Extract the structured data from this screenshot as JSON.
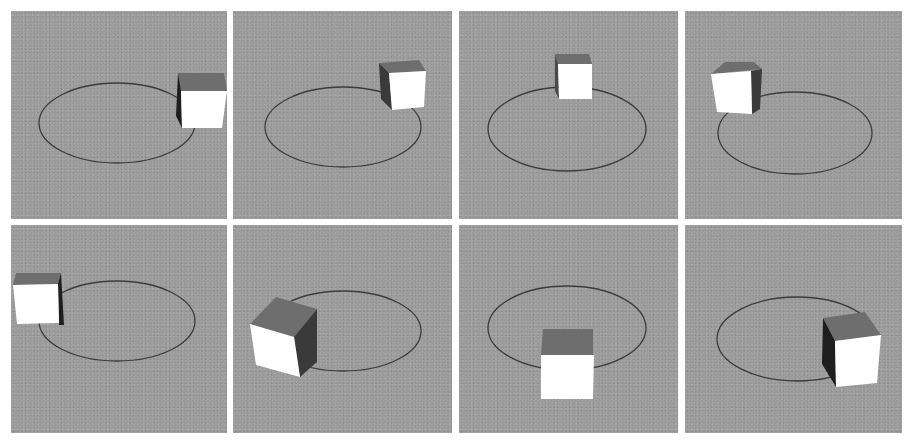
{
  "figure": {
    "background_color": "#ffffff",
    "panel_color": "#9a9a9a",
    "ellipse_color": "#3c3c3c",
    "cube_colors": {
      "front": "#ffffff",
      "top": "#6e6e6e",
      "side": "#3a3a3a"
    },
    "panels": [
      {
        "id": 1,
        "row": 1,
        "col": 1,
        "cube_position": "right"
      },
      {
        "id": 2,
        "row": 1,
        "col": 2,
        "cube_position": "upper-right"
      },
      {
        "id": 3,
        "row": 1,
        "col": 3,
        "cube_position": "top-center"
      },
      {
        "id": 4,
        "row": 1,
        "col": 4,
        "cube_position": "upper-left"
      },
      {
        "id": 5,
        "row": 2,
        "col": 1,
        "cube_position": "left"
      },
      {
        "id": 6,
        "row": 2,
        "col": 2,
        "cube_position": "lower-left"
      },
      {
        "id": 7,
        "row": 2,
        "col": 3,
        "cube_position": "bottom-center"
      },
      {
        "id": 8,
        "row": 2,
        "col": 4,
        "cube_position": "lower-right"
      }
    ]
  }
}
